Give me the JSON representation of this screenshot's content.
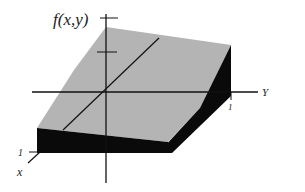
{
  "figure": {
    "colors": {
      "background": "#ffffff",
      "top_face": "#b4b4b4",
      "side_face": "#0a0a0a",
      "axis": "#111111"
    }
  },
  "labels": {
    "z_axis": "f(x,y)",
    "y_axis": "Y",
    "x_axis": "x",
    "y_tick": "1",
    "x_tick": "1"
  }
}
